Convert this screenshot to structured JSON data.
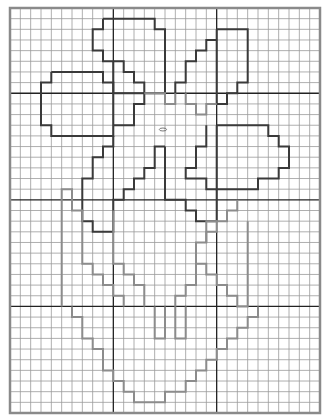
{
  "pattern": {
    "title": "Grid pattern – flower in pot",
    "grid": {
      "cols": 30,
      "rows": 38,
      "left": 10,
      "top": 8,
      "width": 310,
      "height": 405,
      "major_every_col": 10,
      "major_every_row": [
        8,
        18,
        28
      ],
      "minor_color": "#9a9a9a",
      "major_color": "#222222",
      "border_color": "#8a8a8a"
    },
    "colors": {
      "dark_outline": "#3a3a3a",
      "light_outline": "#8c8c8c",
      "background": "#ffffff"
    },
    "shapes": [
      {
        "name": "upper-left-petal",
        "style": "dark",
        "points": [
          [
            9,
            1
          ],
          [
            14,
            1
          ],
          [
            14,
            2
          ],
          [
            15,
            2
          ],
          [
            15,
            8
          ],
          [
            10,
            8
          ],
          [
            10,
            5
          ],
          [
            9,
            5
          ],
          [
            9,
            4
          ],
          [
            8,
            4
          ],
          [
            8,
            2
          ],
          [
            9,
            2
          ],
          [
            9,
            1
          ]
        ]
      },
      {
        "name": "upper-left-petal-steps",
        "style": "dark",
        "points": [
          [
            10,
            5
          ],
          [
            11,
            5
          ],
          [
            11,
            6
          ],
          [
            12,
            6
          ],
          [
            12,
            7
          ],
          [
            13,
            7
          ],
          [
            13,
            8
          ]
        ]
      },
      {
        "name": "upper-right-petal",
        "style": "dark",
        "points": [
          [
            20,
            2
          ],
          [
            23,
            2
          ],
          [
            23,
            7
          ],
          [
            22,
            7
          ],
          [
            22,
            8
          ],
          [
            21,
            8
          ],
          [
            21,
            9
          ],
          [
            20,
            9
          ],
          [
            20,
            2
          ]
        ]
      },
      {
        "name": "upper-right-petal-left-steps",
        "style": "dark",
        "points": [
          [
            20,
            3
          ],
          [
            19,
            3
          ],
          [
            19,
            4
          ],
          [
            18,
            4
          ],
          [
            18,
            5
          ],
          [
            17,
            5
          ],
          [
            17,
            7
          ],
          [
            16,
            7
          ],
          [
            16,
            8
          ]
        ]
      },
      {
        "name": "left-petal",
        "style": "dark",
        "points": [
          [
            4,
            6
          ],
          [
            9,
            6
          ],
          [
            9,
            7
          ],
          [
            10,
            7
          ],
          [
            10,
            12
          ],
          [
            4,
            12
          ],
          [
            4,
            11
          ],
          [
            3,
            11
          ],
          [
            3,
            7
          ],
          [
            4,
            7
          ],
          [
            4,
            6
          ]
        ]
      },
      {
        "name": "left-petal-extension",
        "style": "dark",
        "points": [
          [
            10,
            11
          ],
          [
            12,
            11
          ],
          [
            12,
            9
          ],
          [
            13,
            9
          ],
          [
            13,
            8
          ]
        ]
      },
      {
        "name": "center-connector",
        "style": "light",
        "points": [
          [
            13,
            8
          ],
          [
            15,
            8
          ],
          [
            15,
            9
          ],
          [
            16,
            9
          ],
          [
            16,
            8
          ]
        ]
      },
      {
        "name": "right-center-connector",
        "style": "light",
        "points": [
          [
            17,
            8
          ],
          [
            17,
            9
          ],
          [
            18,
            9
          ],
          [
            18,
            10
          ],
          [
            19,
            10
          ],
          [
            19,
            9
          ],
          [
            20,
            9
          ]
        ]
      },
      {
        "name": "right-petal",
        "style": "dark",
        "points": [
          [
            20,
            11
          ],
          [
            25,
            11
          ],
          [
            25,
            12
          ],
          [
            26,
            12
          ],
          [
            26,
            13
          ],
          [
            27,
            13
          ],
          [
            27,
            15
          ],
          [
            26,
            15
          ],
          [
            26,
            16
          ],
          [
            24,
            16
          ],
          [
            24,
            17
          ],
          [
            20,
            17
          ],
          [
            20,
            11
          ]
        ]
      },
      {
        "name": "right-petal-inner",
        "style": "dark",
        "points": [
          [
            19,
            11
          ],
          [
            19,
            13
          ],
          [
            18,
            13
          ],
          [
            18,
            15
          ],
          [
            17,
            15
          ],
          [
            17,
            16
          ],
          [
            19,
            16
          ],
          [
            19,
            17
          ],
          [
            20,
            17
          ]
        ]
      },
      {
        "name": "lower-left-petal",
        "style": "dark",
        "points": [
          [
            10,
            12
          ],
          [
            10,
            13
          ],
          [
            9,
            13
          ],
          [
            9,
            14
          ],
          [
            8,
            14
          ],
          [
            8,
            16
          ],
          [
            7,
            16
          ],
          [
            7,
            20
          ],
          [
            8,
            20
          ],
          [
            8,
            21
          ],
          [
            10,
            21
          ],
          [
            10,
            18
          ],
          [
            11,
            18
          ],
          [
            11,
            17
          ],
          [
            12,
            17
          ],
          [
            12,
            16
          ],
          [
            13,
            16
          ],
          [
            13,
            15
          ],
          [
            14,
            15
          ],
          [
            14,
            13
          ],
          [
            15,
            13
          ]
        ]
      },
      {
        "name": "lower-center-petal",
        "style": "dark",
        "points": [
          [
            15,
            13
          ],
          [
            15,
            18
          ],
          [
            17,
            18
          ],
          [
            17,
            19
          ],
          [
            18,
            19
          ],
          [
            18,
            20
          ],
          [
            20,
            20
          ],
          [
            20,
            17
          ]
        ]
      },
      {
        "name": "left-leaf",
        "style": "light",
        "points": [
          [
            5,
            28
          ],
          [
            5,
            17
          ],
          [
            6,
            17
          ],
          [
            6,
            19
          ],
          [
            7,
            19
          ],
          [
            7,
            20
          ]
        ]
      },
      {
        "name": "left-leaf-lower",
        "style": "light",
        "points": [
          [
            6,
            28
          ],
          [
            6,
            29
          ],
          [
            7,
            29
          ],
          [
            7,
            31
          ],
          [
            8,
            31
          ],
          [
            8,
            32
          ],
          [
            9,
            32
          ],
          [
            9,
            34
          ],
          [
            10,
            34
          ],
          [
            10,
            35
          ],
          [
            11,
            35
          ],
          [
            11,
            36
          ],
          [
            12,
            36
          ],
          [
            12,
            37
          ],
          [
            15,
            37
          ],
          [
            15,
            36
          ],
          [
            17,
            36
          ],
          [
            17,
            35
          ],
          [
            18,
            35
          ],
          [
            18,
            34
          ],
          [
            19,
            34
          ],
          [
            19,
            33
          ],
          [
            20,
            33
          ],
          [
            20,
            32
          ],
          [
            21,
            32
          ],
          [
            21,
            31
          ],
          [
            22,
            31
          ],
          [
            22,
            30
          ],
          [
            23,
            30
          ],
          [
            23,
            29
          ],
          [
            24,
            29
          ],
          [
            24,
            28
          ]
        ]
      },
      {
        "name": "stem-left",
        "style": "light",
        "points": [
          [
            10,
            19
          ],
          [
            10,
            24
          ],
          [
            11,
            24
          ],
          [
            11,
            25
          ],
          [
            12,
            25
          ],
          [
            12,
            26
          ],
          [
            13,
            26
          ],
          [
            13,
            28
          ]
        ]
      },
      {
        "name": "stem-diagonal-left",
        "style": "light",
        "points": [
          [
            7,
            20
          ],
          [
            7,
            24
          ],
          [
            8,
            24
          ],
          [
            8,
            25
          ],
          [
            9,
            25
          ],
          [
            9,
            26
          ],
          [
            10,
            26
          ],
          [
            10,
            27
          ],
          [
            11,
            27
          ],
          [
            11,
            28
          ]
        ]
      },
      {
        "name": "stem-slot-left",
        "style": "light",
        "points": [
          [
            14,
            28
          ],
          [
            14,
            31
          ],
          [
            15,
            31
          ],
          [
            15,
            28
          ]
        ]
      },
      {
        "name": "stem-slot-right",
        "style": "light",
        "points": [
          [
            16,
            28
          ],
          [
            16,
            31
          ],
          [
            17,
            31
          ],
          [
            17,
            28
          ]
        ]
      },
      {
        "name": "right-leaf",
        "style": "light",
        "points": [
          [
            23,
            20
          ],
          [
            23,
            28
          ],
          [
            22,
            28
          ],
          [
            22,
            27
          ],
          [
            21,
            27
          ],
          [
            21,
            26
          ],
          [
            20,
            26
          ],
          [
            20,
            25
          ],
          [
            19,
            25
          ],
          [
            19,
            24
          ],
          [
            18,
            24
          ],
          [
            18,
            22
          ],
          [
            19,
            22
          ],
          [
            19,
            21
          ],
          [
            20,
            21
          ],
          [
            20,
            20
          ],
          [
            21,
            20
          ],
          [
            21,
            19
          ],
          [
            22,
            19
          ],
          [
            22,
            18
          ]
        ]
      },
      {
        "name": "center-stem-right",
        "style": "light",
        "points": [
          [
            20,
            20
          ],
          [
            19,
            20
          ],
          [
            19,
            22
          ]
        ]
      },
      {
        "name": "right-leaf-inner",
        "style": "light",
        "points": [
          [
            18,
            24
          ],
          [
            18,
            26
          ],
          [
            17,
            26
          ],
          [
            17,
            27
          ],
          [
            16,
            27
          ],
          [
            16,
            28
          ]
        ]
      }
    ],
    "marks": [
      {
        "name": "center-oval-mark",
        "cx": 14.8,
        "cy": 11.4,
        "rx": 0.35,
        "ry": 0.14
      }
    ]
  }
}
